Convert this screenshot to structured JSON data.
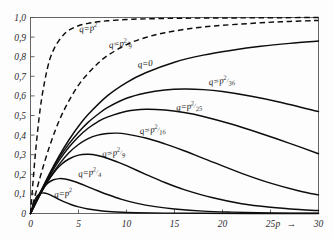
{
  "chart_data": {
    "type": "line",
    "title": "",
    "xlabel": "p",
    "ylabel": "",
    "xlim": [
      0,
      30
    ],
    "ylim": [
      0,
      1.0
    ],
    "grid": false,
    "legend_position": "inline-annotations",
    "decimal_separator": ",",
    "x_ticks": [
      "0",
      "5",
      "10",
      "15",
      "20",
      "25",
      "30"
    ],
    "x_tick_values": [
      0,
      5,
      10,
      15,
      20,
      25,
      30
    ],
    "y_ticks": [
      "0",
      "0,1",
      "0,2",
      "0,3",
      "0,4",
      "0,5",
      "0,6",
      "0,7",
      "0,8",
      "0,9",
      "1,0"
    ],
    "y_tick_values": [
      0,
      0.1,
      0.2,
      0.3,
      0.4,
      0.5,
      0.6,
      0.7,
      0.8,
      0.9,
      1.0
    ],
    "x_axis_arrow": "→",
    "series": [
      {
        "name": "q=p^2 (upper dashed)",
        "label_base": "q=p",
        "label_sup": "2",
        "label_den": "",
        "style": "dashed",
        "label_x": 5.1,
        "label_y": 0.925,
        "x": [
          0,
          0.5,
          1,
          1.5,
          2,
          2.5,
          3,
          3.5,
          4,
          5,
          6,
          7,
          8,
          10,
          12,
          15,
          18,
          22,
          26,
          30
        ],
        "y": [
          0,
          0.3,
          0.53,
          0.68,
          0.785,
          0.845,
          0.885,
          0.915,
          0.935,
          0.958,
          0.97,
          0.978,
          0.983,
          0.99,
          0.993,
          0.996,
          0.997,
          0.998,
          0.999,
          1.0
        ]
      },
      {
        "name": "q=p^2/9 (lower dashed)",
        "label_base": "q=p",
        "label_sup": "2",
        "label_den": "9",
        "style": "dashed",
        "label_x": 8.2,
        "label_y": 0.845,
        "x": [
          0,
          1,
          2,
          3,
          4,
          5,
          6,
          7,
          8,
          10,
          12,
          14,
          17,
          20,
          24,
          27,
          30
        ],
        "y": [
          0,
          0.185,
          0.345,
          0.475,
          0.575,
          0.655,
          0.715,
          0.765,
          0.805,
          0.862,
          0.898,
          0.922,
          0.946,
          0.96,
          0.973,
          0.98,
          0.985
        ]
      },
      {
        "name": "q=0",
        "label_base": "q=0",
        "label_sup": "",
        "label_den": "",
        "style": "solid",
        "label_x": 11.2,
        "label_y": 0.745,
        "x": [
          0,
          1,
          2,
          3,
          4,
          5,
          6,
          8,
          10,
          12,
          15,
          18,
          21,
          24,
          27,
          30
        ],
        "y": [
          0,
          0.105,
          0.205,
          0.295,
          0.375,
          0.445,
          0.505,
          0.6,
          0.668,
          0.718,
          0.772,
          0.808,
          0.833,
          0.853,
          0.868,
          0.88
        ]
      },
      {
        "name": "q=p^2/36",
        "label_base": "q=p",
        "label_sup": "2",
        "label_den": "36",
        "style": "solid",
        "label_x": 18.6,
        "label_y": 0.655,
        "x": [
          0,
          1,
          2,
          3,
          4,
          5,
          6,
          7,
          8,
          10,
          12,
          14,
          16,
          18,
          20,
          23,
          26,
          30
        ],
        "y": [
          0,
          0.105,
          0.2,
          0.285,
          0.355,
          0.415,
          0.465,
          0.505,
          0.54,
          0.588,
          0.615,
          0.63,
          0.635,
          0.632,
          0.622,
          0.598,
          0.568,
          0.52
        ]
      },
      {
        "name": "q=p^2/25",
        "label_base": "q=p",
        "label_sup": "2",
        "label_den": "25",
        "style": "solid",
        "label_x": 15.2,
        "label_y": 0.525,
        "x": [
          0,
          1,
          2,
          3,
          4,
          5,
          6,
          7,
          8,
          10,
          12,
          14,
          16,
          18,
          21,
          24,
          27,
          30
        ],
        "y": [
          0,
          0.1,
          0.192,
          0.272,
          0.338,
          0.392,
          0.435,
          0.468,
          0.492,
          0.522,
          0.532,
          0.528,
          0.515,
          0.495,
          0.455,
          0.408,
          0.358,
          0.305
        ]
      },
      {
        "name": "q=p^2/16",
        "label_base": "q=p",
        "label_sup": "2",
        "label_den": "16",
        "style": "solid",
        "label_x": 11.4,
        "label_y": 0.405,
        "x": [
          0,
          1,
          2,
          3,
          4,
          5,
          6,
          7,
          8,
          9,
          10,
          12,
          14,
          16,
          19,
          22,
          25,
          28,
          30
        ],
        "y": [
          0,
          0.095,
          0.18,
          0.252,
          0.31,
          0.352,
          0.382,
          0.4,
          0.408,
          0.41,
          0.405,
          0.385,
          0.355,
          0.32,
          0.262,
          0.205,
          0.155,
          0.115,
          0.095
        ]
      },
      {
        "name": "q=p^2/9 (solid)",
        "label_base": "q=p",
        "label_sup": "2",
        "label_den": "9",
        "style": "solid",
        "label_x": 7.5,
        "label_y": 0.288,
        "x": [
          0,
          0.8,
          1.6,
          2.4,
          3.2,
          4,
          5,
          6,
          7,
          8,
          9,
          10,
          12,
          14,
          16,
          19,
          22,
          25,
          28,
          30
        ],
        "y": [
          0,
          0.08,
          0.15,
          0.207,
          0.25,
          0.278,
          0.298,
          0.302,
          0.296,
          0.282,
          0.264,
          0.244,
          0.2,
          0.158,
          0.122,
          0.08,
          0.05,
          0.032,
          0.02,
          0.015
        ]
      },
      {
        "name": "q=p^2/4",
        "label_base": "q=p",
        "label_sup": "2",
        "label_den": "4",
        "style": "solid",
        "label_x": 5.0,
        "label_y": 0.188,
        "x": [
          0,
          0.6,
          1.2,
          1.8,
          2.4,
          3,
          3.6,
          4.4,
          5.2,
          6,
          7,
          8,
          9.5,
          11,
          13,
          15,
          18,
          21,
          25,
          30
        ],
        "y": [
          0,
          0.07,
          0.122,
          0.155,
          0.172,
          0.178,
          0.176,
          0.166,
          0.152,
          0.136,
          0.116,
          0.097,
          0.072,
          0.053,
          0.035,
          0.023,
          0.012,
          0.007,
          0.003,
          0.001
        ]
      },
      {
        "name": "q=p^2 (solid lowest)",
        "label_base": "q=p",
        "label_sup": "2",
        "label_den": "",
        "style": "solid",
        "label_x": 2.5,
        "label_y": 0.082,
        "x": [
          0,
          0.35,
          0.7,
          1.05,
          1.4,
          1.8,
          2.2,
          2.8,
          3.4,
          4.2,
          5,
          6,
          7.5,
          9,
          11,
          14,
          18,
          23,
          30
        ],
        "y": [
          0,
          0.058,
          0.09,
          0.103,
          0.105,
          0.1,
          0.091,
          0.076,
          0.062,
          0.046,
          0.034,
          0.023,
          0.013,
          0.008,
          0.004,
          0.002,
          0.001,
          0.0004,
          0.0001
        ]
      }
    ]
  }
}
